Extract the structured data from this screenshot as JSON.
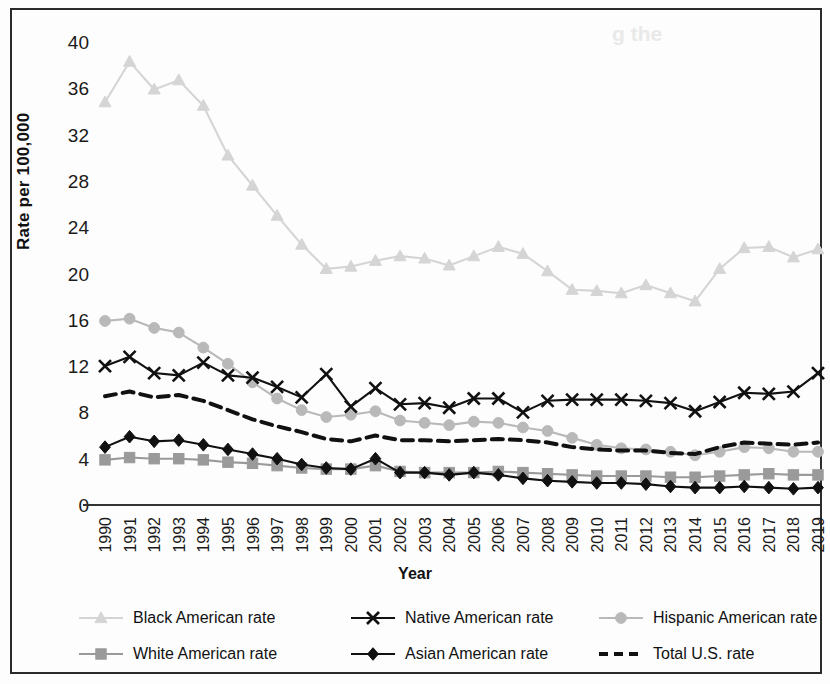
{
  "figure": {
    "y_axis_title": "Rate per 100,000",
    "x_axis_title": "Year"
  },
  "legend": {
    "items": [
      {
        "label": "Black American rate",
        "marker": "triangle-marker",
        "color": "#d5d5d5",
        "line": "solid"
      },
      {
        "label": "Native American rate",
        "marker": "x-marker",
        "color": "#111111",
        "line": "solid"
      },
      {
        "label": "Hispanic American rate",
        "marker": "circle-marker",
        "color": "#b9b9b9",
        "line": "solid"
      },
      {
        "label": "White American rate",
        "marker": "square-marker",
        "color": "#9a9a9a",
        "line": "solid"
      },
      {
        "label": "Asian American rate",
        "marker": "diamond-marker",
        "color": "#111111",
        "line": "solid"
      },
      {
        "label": "Total U.S. rate",
        "marker": "none",
        "color": "#111111",
        "line": "dashed"
      }
    ]
  },
  "chart_data": {
    "type": "line",
    "title": "",
    "xlabel": "Year",
    "ylabel": "Rate per 100,000",
    "xlim": [
      1990,
      2019
    ],
    "ylim": [
      0,
      40
    ],
    "yticks": [
      0,
      4,
      8,
      12,
      16,
      20,
      24,
      28,
      32,
      36,
      40
    ],
    "grid": false,
    "legend_position": "bottom",
    "categories": [
      1990,
      1991,
      1992,
      1993,
      1994,
      1995,
      1996,
      1997,
      1998,
      1999,
      2000,
      2001,
      2002,
      2003,
      2004,
      2005,
      2006,
      2007,
      2008,
      2009,
      2010,
      2011,
      2012,
      2013,
      2014,
      2015,
      2016,
      2017,
      2018,
      2019
    ],
    "series": [
      {
        "name": "Black American rate",
        "color": "#d5d5d5",
        "marker": "triangle",
        "line": "solid",
        "values": [
          34.8,
          38.3,
          35.9,
          36.7,
          34.5,
          30.2,
          27.6,
          25.0,
          22.5,
          20.4,
          20.6,
          21.1,
          21.5,
          21.3,
          20.7,
          21.5,
          22.3,
          21.7,
          20.2,
          18.6,
          18.5,
          18.3,
          19.0,
          18.3,
          17.6,
          20.4,
          22.2,
          22.3,
          21.4,
          22.1
        ]
      },
      {
        "name": "Native American rate",
        "color": "#111111",
        "marker": "x",
        "line": "solid",
        "values": [
          12.0,
          12.8,
          11.4,
          11.2,
          12.3,
          11.2,
          11.0,
          10.2,
          9.3,
          11.3,
          8.5,
          10.1,
          8.7,
          8.8,
          8.4,
          9.2,
          9.2,
          8.0,
          9.0,
          9.1,
          9.1,
          9.1,
          9.0,
          8.8,
          8.1,
          8.9,
          9.7,
          9.6,
          9.8,
          11.4
        ]
      },
      {
        "name": "Hispanic American rate",
        "color": "#b9b9b9",
        "marker": "circle",
        "line": "solid",
        "values": [
          15.9,
          16.1,
          15.3,
          14.9,
          13.6,
          12.2,
          10.6,
          9.2,
          8.2,
          7.6,
          7.8,
          8.1,
          7.3,
          7.1,
          6.9,
          7.2,
          7.1,
          6.7,
          6.4,
          5.8,
          5.2,
          4.9,
          4.8,
          4.6,
          4.3,
          4.6,
          5.0,
          4.9,
          4.6,
          4.6
        ]
      },
      {
        "name": "White American rate",
        "color": "#9a9a9a",
        "marker": "square",
        "line": "solid",
        "values": [
          3.9,
          4.1,
          4.0,
          4.0,
          3.9,
          3.7,
          3.6,
          3.4,
          3.2,
          3.1,
          3.1,
          3.4,
          2.9,
          2.8,
          2.8,
          2.8,
          2.9,
          2.8,
          2.7,
          2.6,
          2.5,
          2.5,
          2.5,
          2.4,
          2.4,
          2.5,
          2.6,
          2.7,
          2.6,
          2.6
        ]
      },
      {
        "name": "Asian American rate",
        "color": "#111111",
        "marker": "diamond",
        "line": "solid",
        "values": [
          5.0,
          5.9,
          5.5,
          5.6,
          5.2,
          4.8,
          4.4,
          4.0,
          3.5,
          3.2,
          3.1,
          4.0,
          2.8,
          2.8,
          2.6,
          2.8,
          2.6,
          2.3,
          2.1,
          2.0,
          1.9,
          1.9,
          1.8,
          1.6,
          1.5,
          1.5,
          1.6,
          1.5,
          1.4,
          1.5
        ]
      },
      {
        "name": "Total U.S. rate",
        "color": "#111111",
        "marker": "none",
        "line": "dashed",
        "values": [
          9.4,
          9.8,
          9.3,
          9.5,
          9.0,
          8.2,
          7.4,
          6.8,
          6.3,
          5.7,
          5.5,
          6.0,
          5.6,
          5.6,
          5.5,
          5.6,
          5.7,
          5.6,
          5.4,
          5.0,
          4.8,
          4.7,
          4.7,
          4.5,
          4.4,
          5.0,
          5.4,
          5.3,
          5.2,
          5.4
        ]
      }
    ]
  }
}
